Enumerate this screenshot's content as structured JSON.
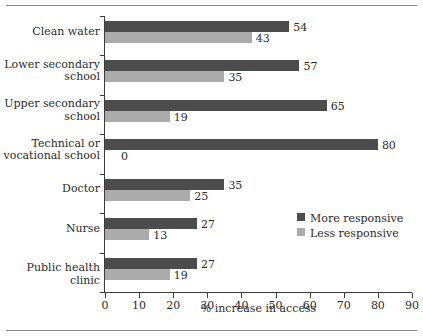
{
  "chart_data": {
    "type": "bar",
    "orientation": "horizontal",
    "title": "",
    "xlabel": "% increase in access",
    "ylabel": "",
    "xlim": [
      0,
      90
    ],
    "xticks": [
      0,
      10,
      20,
      30,
      40,
      50,
      60,
      70,
      80,
      90
    ],
    "grid": false,
    "legend_position": "center-right",
    "categories": [
      "Clean water",
      "Lower secondary\nschool",
      "Upper secondary\nschool",
      "Technical or\nvocational school",
      "Doctor",
      "Nurse",
      "Public health clinic"
    ],
    "series": [
      {
        "name": "More responsive",
        "color": "#4c4c4c",
        "values": [
          54,
          57,
          65,
          80,
          35,
          27,
          27
        ]
      },
      {
        "name": "Less responsive",
        "color": "#ababab",
        "values": [
          43,
          35,
          19,
          0,
          25,
          13,
          19
        ]
      }
    ]
  },
  "legend": {
    "items": [
      {
        "label": "More responsive",
        "color": "#4c4c4c"
      },
      {
        "label": "Less responsive",
        "color": "#ababab"
      }
    ]
  },
  "axis": {
    "x_title": "% increase in access"
  }
}
